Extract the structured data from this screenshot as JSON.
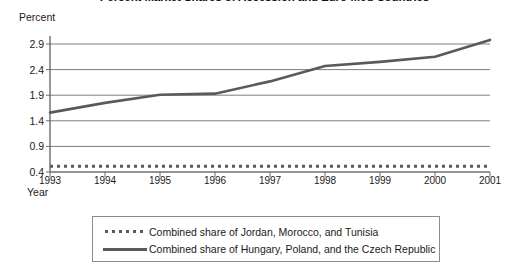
{
  "chart_data": {
    "type": "line",
    "title": "Percent Market Shares of Accession and Euro-Med Countries",
    "xlabel": "Year",
    "ylabel": "Percent",
    "categories": [
      "1993",
      "1994",
      "1995",
      "1996",
      "1997",
      "1998",
      "1999",
      "2000",
      "2001"
    ],
    "x": [
      1993,
      1994,
      1995,
      1996,
      1997,
      1998,
      1999,
      2000,
      2001
    ],
    "xlim": [
      1993,
      2001
    ],
    "ylim": [
      0.4,
      2.9
    ],
    "yticks": [
      "0.4",
      "0.9",
      "1.4",
      "1.9",
      "2.4",
      "2.9"
    ],
    "ytick_values": [
      0.4,
      0.9,
      1.4,
      1.9,
      2.4,
      2.9
    ],
    "grid": "horizontal",
    "legend_position": "bottom",
    "series": [
      {
        "name": "Combined share of Jordan, Morocco, and Tunisia",
        "style": "dotted",
        "color": "#5a5a5a",
        "values": [
          0.51,
          0.51,
          0.51,
          0.51,
          0.51,
          0.51,
          0.51,
          0.51,
          0.51
        ]
      },
      {
        "name": "Combined share of Hungary, Poland, and the Czech Republic",
        "style": "solid",
        "color": "#5a5a5a",
        "values": [
          1.56,
          1.75,
          1.91,
          1.93,
          2.17,
          2.47,
          2.55,
          2.65,
          2.98
        ]
      }
    ]
  },
  "legend": {
    "entries": [
      {
        "label": "Combined share of Jordan, Morocco, and Tunisia",
        "style": "dotted"
      },
      {
        "label": "Combined share of Hungary, Poland, and the Czech Republic",
        "style": "solid"
      }
    ]
  },
  "colors": {
    "line": "#5a5a5a",
    "axis": "#6b6b6b",
    "grid": "#6f6f6f",
    "text": "#1a1a1a",
    "legend_border": "#8c8c8c"
  }
}
